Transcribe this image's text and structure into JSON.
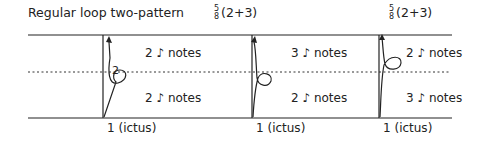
{
  "title": "Regular loop two-pattern",
  "meters": [
    {
      "numerator": "5",
      "denominator": "8",
      "grouping": "(2+3)"
    },
    {
      "numerator": "5",
      "denominator": "8",
      "grouping": "(2+3)"
    }
  ],
  "patterns": [
    {
      "upper": "2 ♪ notes",
      "lower": "2 ♪ notes",
      "downbeat": "1 (ictus)",
      "loop_label": "2"
    },
    {
      "upper": "3 ♪ notes",
      "lower": "2 ♪ notes",
      "downbeat": "1 (ictus)"
    },
    {
      "upper": "2 ♪ notes",
      "lower": "3 ♪ notes",
      "downbeat": "1 (ictus)"
    }
  ],
  "colors": {
    "line": "#222222",
    "text": "#222222"
  }
}
